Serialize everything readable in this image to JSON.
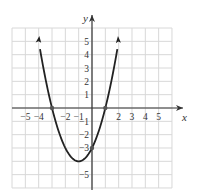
{
  "chart_data": {
    "type": "line",
    "title": "",
    "xlabel": "x",
    "ylabel": "y",
    "xlim": [
      -6,
      6
    ],
    "ylim": [
      -6,
      6
    ],
    "grid": true,
    "x_tick_labels": [
      "-5",
      "-4",
      "-2",
      "-1",
      "2",
      "3",
      "4",
      "5"
    ],
    "y_tick_labels": [
      "5",
      "4",
      "3",
      "2",
      "1",
      "-1",
      "-2",
      "-3",
      "-5"
    ],
    "series": [
      {
        "name": "y = x^2 + 2x - 3",
        "function": "x^2 + 2x - 3",
        "x": [
          -4,
          -3,
          -2,
          -1,
          0,
          1,
          2
        ],
        "values": [
          5,
          0,
          -3,
          -4,
          -3,
          0,
          5
        ],
        "arrows_at_ends": true
      }
    ],
    "marked_points": [
      {
        "x": -3,
        "y": 0
      },
      {
        "x": 1,
        "y": 0
      },
      {
        "x": 0,
        "y": -3
      }
    ],
    "vertex": {
      "x": -1,
      "y": -4
    }
  },
  "colors": {
    "grid": "#d8d8d8",
    "axis": "#333333",
    "curve": "#222222",
    "text": "#333333"
  }
}
